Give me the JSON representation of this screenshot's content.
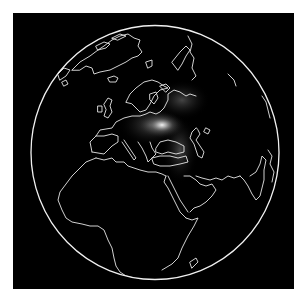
{
  "map": {
    "projection": "orthographic",
    "view_center": "Eastern Europe / Black Sea",
    "background_color": "#000000",
    "page_background": "#ffffff",
    "coastline_color": "#e8e8e8",
    "glow_color": "#ffffff",
    "regions_visible": [
      "Greenland",
      "Iceland",
      "Europe",
      "Scandinavia",
      "Africa",
      "Middle East",
      "Arabian Peninsula",
      "India",
      "Caspian Sea",
      "Black Sea",
      "Mediterranean Sea",
      "Madagascar"
    ],
    "density_hotspot": {
      "location": "Ukraine / Western Russia",
      "intensity": "high",
      "spread": "Eastern Europe to Caspian region"
    }
  }
}
